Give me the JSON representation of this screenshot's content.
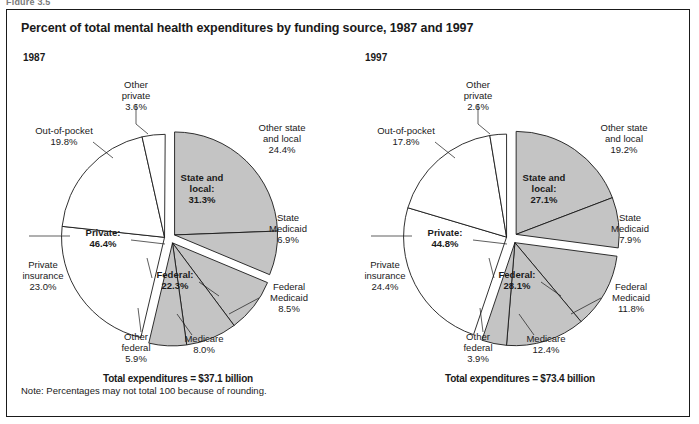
{
  "figure_caption_partial": "Figure 3.5",
  "figure": {
    "title": "Percent of total mental health expenditures by funding source, 1987 and 1997",
    "note": "Note: Percentages may not total 100 because of rounding."
  },
  "colors": {
    "public_fill": "#c4c4c4",
    "private_fill": "#ffffff",
    "stroke": "#1a1a1a",
    "text": "#1a1a1a"
  },
  "panels": [
    {
      "year": "1987",
      "total_label": "Total expenditures = $37.1 billion",
      "groups": [
        {
          "name": "Private",
          "label": "Private:",
          "value_label": "46.4%",
          "value": 46.4
        },
        {
          "name": "State and local",
          "label": "State and local:",
          "value_label": "31.3%",
          "value": 31.3
        },
        {
          "name": "Federal",
          "label": "Federal:",
          "value_label": "22.3%",
          "value": 22.3
        }
      ],
      "slices": [
        {
          "name": "Other private",
          "label": "Other private",
          "value_label": "3.6%",
          "value": 3.6,
          "group": "Private"
        },
        {
          "name": "Out-of-pocket",
          "label": "Out-of-pocket",
          "value_label": "19.8%",
          "value": 19.8,
          "group": "Private"
        },
        {
          "name": "Private insurance",
          "label": "Private insurance",
          "value_label": "23.0%",
          "value": 23.0,
          "group": "Private"
        },
        {
          "name": "Other federal",
          "label": "Other federal",
          "value_label": "5.9%",
          "value": 5.9,
          "group": "Federal"
        },
        {
          "name": "Medicare",
          "label": "Medicare",
          "value_label": "8.0%",
          "value": 8.0,
          "group": "Federal"
        },
        {
          "name": "Federal Medicaid",
          "label": "Federal Medicaid",
          "value_label": "8.5%",
          "value": 8.5,
          "group": "Federal"
        },
        {
          "name": "State Medicaid",
          "label": "State Medicaid",
          "value_label": "6.9%",
          "value": 6.9,
          "group": "State and local"
        },
        {
          "name": "Other state and local",
          "label": "Other state and local",
          "value_label": "24.4%",
          "value": 24.4,
          "group": "State and local"
        }
      ]
    },
    {
      "year": "1997",
      "total_label": "Total expenditures = $73.4 billion",
      "groups": [
        {
          "name": "Private",
          "label": "Private:",
          "value_label": "44.8%",
          "value": 44.8
        },
        {
          "name": "State and local",
          "label": "State and local:",
          "value_label": "27.1%",
          "value": 27.1
        },
        {
          "name": "Federal",
          "label": "Federal:",
          "value_label": "28.1%",
          "value": 28.1
        }
      ],
      "slices": [
        {
          "name": "Other private",
          "label": "Other private",
          "value_label": "2.6%",
          "value": 2.6,
          "group": "Private"
        },
        {
          "name": "Out-of-pocket",
          "label": "Out-of-pocket",
          "value_label": "17.8%",
          "value": 17.8,
          "group": "Private"
        },
        {
          "name": "Private insurance",
          "label": "Private insurance",
          "value_label": "24.4%",
          "value": 24.4,
          "group": "Private"
        },
        {
          "name": "Other federal",
          "label": "Other federal",
          "value_label": "3.9%",
          "value": 3.9,
          "group": "Federal"
        },
        {
          "name": "Medicare",
          "label": "Medicare",
          "value_label": "12.4%",
          "value": 12.4,
          "group": "Federal"
        },
        {
          "name": "Federal Medicaid",
          "label": "Federal Medicaid",
          "value_label": "11.8%",
          "value": 11.8,
          "group": "Federal"
        },
        {
          "name": "State Medicaid",
          "label": "State Medicaid",
          "value_label": "7.9%",
          "value": 7.9,
          "group": "State and local"
        },
        {
          "name": "Other state and local",
          "label": "Other state and local",
          "value_label": "19.2%",
          "value": 19.2,
          "group": "State and local"
        }
      ]
    }
  ],
  "chart_data": {
    "type": "pie",
    "title": "Percent of total mental health expenditures by funding source, 1987 and 1997",
    "note": "Note: Percentages may not total 100 because of rounding.",
    "unit": "percent of total mental health expenditures",
    "charts": [
      {
        "title": "1987",
        "total": "Total expenditures = $37.1 billion",
        "total_value": 37.1,
        "total_unit": "billion USD",
        "categories": [
          "Other private",
          "Out-of-pocket",
          "Private insurance",
          "Other federal",
          "Medicare",
          "Federal Medicaid",
          "State Medicaid",
          "Other state and local"
        ],
        "values": [
          3.6,
          19.8,
          23.0,
          5.9,
          8.0,
          8.5,
          6.9,
          24.4
        ],
        "group_categories": [
          "Private",
          "Federal",
          "State and local"
        ],
        "group_values": [
          46.4,
          22.3,
          31.3
        ]
      },
      {
        "title": "1997",
        "total": "Total expenditures = $73.4 billion",
        "total_value": 73.4,
        "total_unit": "billion USD",
        "categories": [
          "Other private",
          "Out-of-pocket",
          "Private insurance",
          "Other federal",
          "Medicare",
          "Federal Medicaid",
          "State Medicaid",
          "Other state and local"
        ],
        "values": [
          2.6,
          17.8,
          24.4,
          3.9,
          12.4,
          11.8,
          7.9,
          19.2
        ],
        "group_categories": [
          "Private",
          "Federal",
          "State and local"
        ],
        "group_values": [
          44.8,
          28.1,
          27.1
        ]
      }
    ],
    "legend": "none",
    "grid": false
  }
}
